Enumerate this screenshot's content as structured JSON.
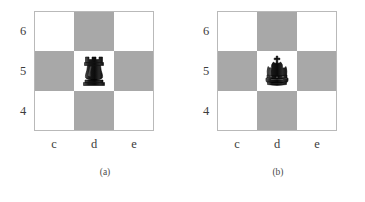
{
  "figure": {
    "background_color": "#ffffff",
    "light_square_color": "#ffffff",
    "dark_square_color": "#a8a8a8",
    "border_color": "#b9b9b9",
    "piece_color": "#141414",
    "boards": [
      {
        "caption": "(a)",
        "rank_labels": [
          "6",
          "5",
          "4"
        ],
        "file_labels": [
          "c",
          "d",
          "e"
        ],
        "squares": [
          {
            "name": "c6",
            "shade": "light",
            "piece": ""
          },
          {
            "name": "d6",
            "shade": "dark",
            "piece": ""
          },
          {
            "name": "e6",
            "shade": "light",
            "piece": ""
          },
          {
            "name": "c5",
            "shade": "dark",
            "piece": ""
          },
          {
            "name": "d5",
            "shade": "light",
            "piece": "black-rook"
          },
          {
            "name": "e5",
            "shade": "dark",
            "piece": ""
          },
          {
            "name": "c4",
            "shade": "light",
            "piece": ""
          },
          {
            "name": "d4",
            "shade": "dark",
            "piece": ""
          },
          {
            "name": "e4",
            "shade": "light",
            "piece": ""
          }
        ]
      },
      {
        "caption": "(b)",
        "rank_labels": [
          "6",
          "5",
          "4"
        ],
        "file_labels": [
          "c",
          "d",
          "e"
        ],
        "squares": [
          {
            "name": "c6",
            "shade": "light",
            "piece": ""
          },
          {
            "name": "d6",
            "shade": "dark",
            "piece": ""
          },
          {
            "name": "e6",
            "shade": "light",
            "piece": ""
          },
          {
            "name": "c5",
            "shade": "dark",
            "piece": ""
          },
          {
            "name": "d5",
            "shade": "light",
            "piece": "black-king"
          },
          {
            "name": "e5",
            "shade": "dark",
            "piece": ""
          },
          {
            "name": "c4",
            "shade": "light",
            "piece": ""
          },
          {
            "name": "d4",
            "shade": "dark",
            "piece": ""
          },
          {
            "name": "e4",
            "shade": "light",
            "piece": ""
          }
        ]
      }
    ]
  }
}
